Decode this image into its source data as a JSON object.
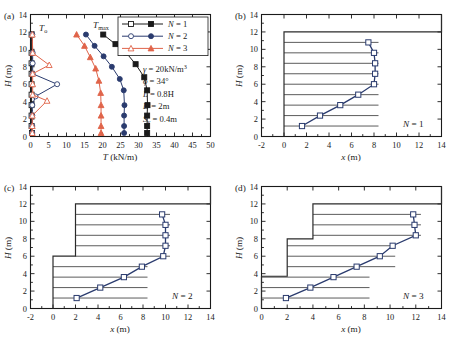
{
  "figure": {
    "panel_tags": [
      "(a)",
      "(b)",
      "(c)",
      "(d)"
    ]
  },
  "panel_a": {
    "tag": "(a)",
    "xlabel_main": "T",
    "xlabel_unit": " (kN/m)",
    "ylabel_main": "H",
    "ylabel_unit": " (m)",
    "xticks": [
      0,
      5,
      10,
      15,
      20,
      25,
      30,
      35,
      40,
      45,
      50
    ],
    "yticks": [
      0,
      2,
      4,
      6,
      8,
      10,
      12,
      14
    ],
    "curve_label_T0": "T",
    "curve_label_T0_sub": "o",
    "curve_label_Tmax": "T",
    "curve_label_Tmax_sub": "max",
    "legend": [
      {
        "label": "N = 1",
        "label_italic": "N",
        "label_rest": " = 1",
        "color": "#1a1a1a"
      },
      {
        "label": "N = 2",
        "label_italic": "N",
        "label_rest": " = 2",
        "color": "#2a3b6e"
      },
      {
        "label": "N = 3",
        "label_italic": "N",
        "label_rest": " = 3",
        "color": "#e0644a"
      }
    ],
    "params": [
      {
        "symbol": "γ",
        "rest": " = 20kN/m",
        "sup": "3"
      },
      {
        "symbol": "ϕ",
        "rest": " = 34°",
        "sup": ""
      },
      {
        "symbol": "L",
        "rest": " = 0.8H",
        "sup": ""
      },
      {
        "symbol": "D",
        "rest": " = 2m",
        "sup": ""
      },
      {
        "symbol": "S",
        "sub": "v",
        "rest": " = 0.4m",
        "sup": ""
      }
    ]
  },
  "panel_b": {
    "tag": "(b)",
    "case_label_italic": "N",
    "case_label_rest": " = 1",
    "xlabel_main": "x",
    "xlabel_unit": " (m)",
    "ylabel_main": "H",
    "ylabel_unit": " (m)",
    "xticks": [
      -2,
      0,
      2,
      4,
      6,
      8,
      10,
      12,
      14
    ],
    "yticks": [
      0,
      2,
      4,
      6,
      8,
      10,
      12,
      14
    ]
  },
  "panel_c": {
    "tag": "(c)",
    "case_label_italic": "N",
    "case_label_rest": " = 2",
    "xlabel_main": "x",
    "xlabel_unit": " (m)",
    "ylabel_main": "H",
    "ylabel_unit": " (m)",
    "xticks": [
      -2,
      0,
      2,
      4,
      6,
      8,
      10,
      12,
      14
    ],
    "yticks": [
      0,
      2,
      4,
      6,
      8,
      10,
      12,
      14
    ]
  },
  "panel_d": {
    "tag": "(d)",
    "case_label_italic": "N",
    "case_label_rest": " = 3",
    "xlabel_main": "x",
    "xlabel_unit": " (m)",
    "ylabel_main": "H",
    "ylabel_unit": " (m)",
    "xticks": [
      0,
      2,
      4,
      6,
      8,
      10,
      12,
      14
    ],
    "yticks": [
      0,
      2,
      4,
      6,
      8,
      10,
      12,
      14
    ]
  },
  "chart_data": [
    {
      "id": "panel_a",
      "type": "line",
      "title": "(a) Reinforcement tensile force distribution",
      "xlabel": "T (kN/m)",
      "ylabel": "H (m)",
      "xlim": [
        0,
        50
      ],
      "ylim": [
        0,
        14
      ],
      "xticks": [
        0,
        5,
        10,
        15,
        20,
        25,
        30,
        35,
        40,
        45,
        50
      ],
      "yticks": [
        0,
        2,
        4,
        6,
        8,
        10,
        12,
        14
      ],
      "grid": false,
      "legend_position": "top-right",
      "annotations": [
        "Tₒ",
        "Tₘₐₓ",
        "γ = 20kN/m³",
        "ϕ = 34°",
        "L = 0.8H",
        "D = 2m",
        "Sᵥ = 0.4m"
      ],
      "series": [
        {
          "name": "N = 1 (To)",
          "marker": "open-square",
          "color": "#1a1a1a",
          "x": [
            0.4,
            0.3,
            0.3,
            0.3,
            0.3,
            0.3,
            0.3,
            0.3,
            0.3,
            0.3
          ],
          "y": [
            0.4,
            1.2,
            2.4,
            3.6,
            4.8,
            6.0,
            7.2,
            8.4,
            9.6,
            11.7
          ]
        },
        {
          "name": "N = 1 (Tmax)",
          "marker": "filled-square",
          "color": "#1a1a1a",
          "x": [
            32.4,
            32.4,
            32.4,
            32.5,
            32.4,
            31.6,
            29.2,
            26.6,
            23.6,
            20.2
          ],
          "y": [
            0.4,
            1.2,
            2.4,
            3.6,
            5.3,
            6.8,
            8.3,
            9.6,
            10.6,
            11.7
          ]
        },
        {
          "name": "N = 2 (To)",
          "marker": "open-circle",
          "color": "#2a3b6e",
          "x": [
            0.5,
            0.5,
            0.5,
            0.5,
            1.4,
            7.4,
            0.6,
            0.6,
            0.6,
            0.5
          ],
          "y": [
            0.4,
            1.2,
            2.4,
            3.6,
            4.6,
            6.0,
            7.2,
            8.4,
            9.6,
            11.7
          ]
        },
        {
          "name": "N = 2 (Tmax)",
          "marker": "filled-circle",
          "color": "#2a3b6e",
          "x": [
            26.0,
            26.0,
            26.0,
            26.1,
            25.9,
            24.8,
            22.6,
            20.3,
            17.8,
            15.4
          ],
          "y": [
            0.4,
            1.2,
            2.4,
            3.6,
            5.3,
            6.6,
            8.0,
            9.2,
            10.4,
            11.7
          ]
        },
        {
          "name": "N = 3 (To)",
          "marker": "open-triangle",
          "color": "#e0644a",
          "x": [
            0.5,
            0.5,
            0.5,
            4.6,
            0.6,
            0.6,
            0.6,
            5.2,
            0.6,
            0.5
          ],
          "y": [
            0.4,
            1.2,
            2.4,
            4.1,
            4.8,
            6.0,
            7.2,
            8.2,
            9.6,
            11.7
          ]
        },
        {
          "name": "N = 3 (Tmax)",
          "marker": "filled-triangle",
          "color": "#e0644a",
          "x": [
            19.6,
            19.6,
            19.6,
            19.6,
            19.5,
            19.0,
            18.1,
            16.6,
            15.0,
            12.8
          ],
          "y": [
            0.4,
            1.2,
            2.4,
            3.6,
            5.0,
            6.4,
            7.8,
            9.1,
            10.4,
            11.7
          ]
        }
      ]
    },
    {
      "id": "panel_b",
      "type": "line",
      "title": "(b) N = 1 single-tier wall failure surface",
      "xlabel": "x (m)",
      "ylabel": "H (m)",
      "xlim": [
        -2,
        14
      ],
      "ylim": [
        0,
        14
      ],
      "xticks": [
        -2,
        0,
        2,
        4,
        6,
        8,
        10,
        12,
        14
      ],
      "yticks": [
        0,
        2,
        4,
        6,
        8,
        10,
        12,
        14
      ],
      "grid": false,
      "annotations": [
        "N = 1"
      ],
      "wall_outline": [
        [
          0,
          0
        ],
        [
          0,
          12
        ],
        [
          14,
          12
        ],
        [
          14,
          14
        ]
      ],
      "wall_height": 12,
      "tiers": 1,
      "reinforcement_layers": [
        {
          "y": 1.2,
          "x_start": 0,
          "x_end": 8.4
        },
        {
          "y": 2.4,
          "x_start": 0,
          "x_end": 8.4
        },
        {
          "y": 3.6,
          "x_start": 0,
          "x_end": 8.4
        },
        {
          "y": 4.8,
          "x_start": 0,
          "x_end": 8.4
        },
        {
          "y": 6.0,
          "x_start": 0,
          "x_end": 8.4
        },
        {
          "y": 7.2,
          "x_start": 0,
          "x_end": 8.4
        },
        {
          "y": 8.4,
          "x_start": 0,
          "x_end": 8.4
        },
        {
          "y": 9.6,
          "x_start": 0,
          "x_end": 8.4
        },
        {
          "y": 10.8,
          "x_start": 0,
          "x_end": 8.4
        }
      ],
      "failure_surface": {
        "marker": "open-square",
        "color": "#2a3b6e",
        "x": [
          1.6,
          3.2,
          5.0,
          6.6,
          8.0,
          8.1,
          8.1,
          8.0,
          7.5
        ],
        "y": [
          1.2,
          2.4,
          3.6,
          4.8,
          6.0,
          7.2,
          8.4,
          9.6,
          10.8
        ]
      }
    },
    {
      "id": "panel_c",
      "type": "line",
      "title": "(c) N = 2 two-tier wall failure surface",
      "xlabel": "x (m)",
      "ylabel": "H (m)",
      "xlim": [
        -2,
        14
      ],
      "ylim": [
        0,
        14
      ],
      "xticks": [
        -2,
        0,
        2,
        4,
        6,
        8,
        10,
        12,
        14
      ],
      "yticks": [
        0,
        2,
        4,
        6,
        8,
        10,
        12,
        14
      ],
      "grid": false,
      "annotations": [
        "N = 2"
      ],
      "wall_outline": [
        [
          0,
          0
        ],
        [
          0,
          6
        ],
        [
          2,
          6
        ],
        [
          2,
          12
        ],
        [
          14,
          12
        ],
        [
          14,
          14
        ]
      ],
      "wall_height": 12,
      "tiers": 2,
      "tier_offsets": [
        0,
        2
      ],
      "reinforcement_layers": [
        {
          "y": 1.2,
          "x_start": 0,
          "x_end": 8.4
        },
        {
          "y": 2.4,
          "x_start": 0,
          "x_end": 8.4
        },
        {
          "y": 3.6,
          "x_start": 0,
          "x_end": 8.4
        },
        {
          "y": 4.8,
          "x_start": 0,
          "x_end": 8.4
        },
        {
          "y": 6.0,
          "x_start": 2,
          "x_end": 10.4
        },
        {
          "y": 7.2,
          "x_start": 2,
          "x_end": 10.4
        },
        {
          "y": 8.4,
          "x_start": 2,
          "x_end": 10.4
        },
        {
          "y": 9.6,
          "x_start": 2,
          "x_end": 10.4
        },
        {
          "y": 10.8,
          "x_start": 2,
          "x_end": 10.4
        }
      ],
      "failure_surface": {
        "marker": "open-square",
        "color": "#2a3b6e",
        "x": [
          2.1,
          4.2,
          6.3,
          7.9,
          9.8,
          10.0,
          10.0,
          10.0,
          9.7
        ],
        "y": [
          1.2,
          2.4,
          3.6,
          4.8,
          6.0,
          7.2,
          8.4,
          9.6,
          10.8
        ]
      }
    },
    {
      "id": "panel_d",
      "type": "line",
      "title": "(d) N = 3 three-tier wall failure surface",
      "xlabel": "x (m)",
      "ylabel": "H (m)",
      "xlim": [
        0,
        14
      ],
      "ylim": [
        0,
        14
      ],
      "xticks": [
        0,
        2,
        4,
        6,
        8,
        10,
        12,
        14
      ],
      "yticks": [
        0,
        2,
        4,
        6,
        8,
        10,
        12,
        14
      ],
      "grid": false,
      "annotations": [
        "N = 3"
      ],
      "wall_outline": [
        [
          0,
          0
        ],
        [
          0,
          3.7
        ],
        [
          2,
          3.7
        ],
        [
          2,
          8.0
        ],
        [
          4,
          8.0
        ],
        [
          4,
          12
        ],
        [
          14,
          12
        ],
        [
          14,
          14
        ]
      ],
      "wall_height": 12,
      "tiers": 3,
      "tier_offsets": [
        0,
        2,
        4
      ],
      "reinforcement_layers": [
        {
          "y": 1.2,
          "x_start": 0,
          "x_end": 8.4
        },
        {
          "y": 2.4,
          "x_start": 0,
          "x_end": 8.4
        },
        {
          "y": 3.6,
          "x_start": 0,
          "x_end": 8.4
        },
        {
          "y": 4.8,
          "x_start": 2,
          "x_end": 10.4
        },
        {
          "y": 6.0,
          "x_start": 2,
          "x_end": 10.4
        },
        {
          "y": 7.2,
          "x_start": 2,
          "x_end": 10.4
        },
        {
          "y": 8.4,
          "x_start": 4,
          "x_end": 12.4
        },
        {
          "y": 9.6,
          "x_start": 4,
          "x_end": 12.4
        },
        {
          "y": 10.8,
          "x_start": 4,
          "x_end": 12.4
        }
      ],
      "failure_surface": {
        "marker": "open-square",
        "color": "#2a3b6e",
        "x": [
          1.9,
          3.8,
          5.6,
          7.4,
          9.2,
          10.2,
          12.0,
          11.9,
          11.8
        ],
        "y": [
          1.2,
          2.4,
          3.6,
          4.8,
          6.0,
          7.2,
          8.4,
          9.6,
          10.8
        ]
      }
    }
  ]
}
